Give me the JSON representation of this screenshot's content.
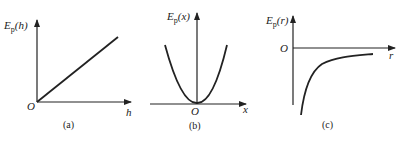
{
  "panels": [
    {
      "id": "a",
      "ylabel_main": "E",
      "ylabel_sub": "p",
      "ylabel_arg": "(h)",
      "xlabel": "h",
      "origin": "O",
      "caption": "(a)",
      "curve": "linear"
    },
    {
      "id": "b",
      "ylabel_main": "E",
      "ylabel_sub": "p",
      "ylabel_arg": "(x)",
      "xlabel": "x",
      "origin": "O",
      "caption": "(b)",
      "curve": "parabola"
    },
    {
      "id": "c",
      "ylabel_main": "E",
      "ylabel_sub": "p",
      "ylabel_arg": "(r)",
      "xlabel": "r",
      "origin": "O",
      "caption": "(c)",
      "curve": "negative-inverse"
    }
  ],
  "colors": {
    "ink": "#222222",
    "background": "#ffffff"
  }
}
